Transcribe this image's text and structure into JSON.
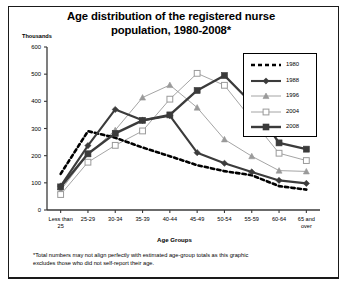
{
  "chart_data": {
    "type": "line",
    "title": "Age distribution of the registered nurse population, 1980-2008*",
    "title_line1": "Age distribution of the registered nurse",
    "title_line2": "population, 1980-2008*",
    "xlabel": "Age Groups",
    "ylabel": "Thousands",
    "ylim": [
      0,
      600
    ],
    "ytick_labels": [
      "0",
      "100",
      "200",
      "300",
      "400",
      "500",
      "600"
    ],
    "yticks": [
      0,
      100,
      200,
      300,
      400,
      500,
      600
    ],
    "grid": false,
    "legend_position": "top-right",
    "categories": [
      "Less than 25",
      "25-29",
      "30-34",
      "35-39",
      "40-44",
      "45-49",
      "50-54",
      "55-59",
      "60-64",
      "65 and over"
    ],
    "categories_display": [
      [
        "Less than",
        "25"
      ],
      [
        "25-29",
        ""
      ],
      [
        "30-34",
        ""
      ],
      [
        "35-39",
        ""
      ],
      [
        "40-44",
        ""
      ],
      [
        "45-49",
        ""
      ],
      [
        "50-54",
        ""
      ],
      [
        "55-59",
        ""
      ],
      [
        "60-64",
        ""
      ],
      [
        "65 and",
        "over"
      ]
    ],
    "series": [
      {
        "name": "1980",
        "style": "dashed",
        "marker": "none",
        "color": "#000000",
        "width": 2.6,
        "values": [
          133,
          290,
          266,
          230,
          198,
          165,
          143,
          128,
          88,
          75
        ]
      },
      {
        "name": "1988",
        "style": "solid",
        "marker": "diamond",
        "color": "#3b3b3b",
        "width": 2.1,
        "values": [
          88,
          237,
          370,
          330,
          347,
          211,
          172,
          140,
          109,
          98
        ]
      },
      {
        "name": "1996",
        "style": "solid",
        "marker": "triangle",
        "color": "#9a9a9a",
        "width": 0.9,
        "values": [
          72,
          205,
          294,
          414,
          460,
          377,
          260,
          198,
          145,
          142
        ]
      },
      {
        "name": "2004",
        "style": "solid",
        "marker": "open-square",
        "color": "#9a9a9a",
        "width": 0.9,
        "values": [
          57,
          176,
          238,
          291,
          408,
          503,
          459,
          333,
          209,
          182
        ]
      },
      {
        "name": "2008",
        "style": "solid",
        "marker": "filled-square",
        "color": "#3b3b3b",
        "width": 2.4,
        "values": [
          85,
          207,
          282,
          330,
          350,
          440,
          495,
          393,
          247,
          224
        ]
      }
    ],
    "footnote": "*Total numbers may not align perfectly with estimated age-group totals as this graphic excludes those who did not self-report their age.",
    "footnote_line1": "*Total numbers may not align perfectly with estimated age-group totals as this graphic",
    "footnote_line2": "excludes those who did not self-report their age."
  }
}
